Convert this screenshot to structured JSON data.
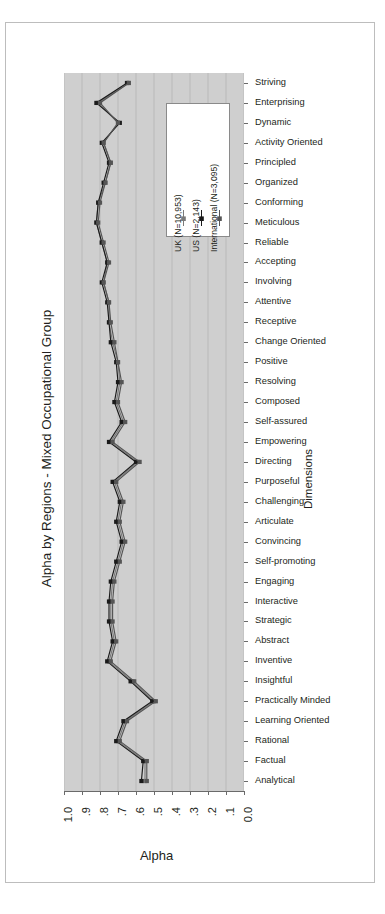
{
  "figure": {
    "title": "Alpha by Regions - Mixed Occupational Group",
    "xlabel": "Alpha",
    "ylabel": "Dimensions"
  },
  "legend": {
    "items": [
      {
        "label": "UK (N=10,953)",
        "color": "#7a7a7a",
        "marker": "error-bar-marker"
      },
      {
        "label": "US (N=2,143)",
        "color": "#1a1a1a",
        "marker": "error-bar-marker"
      },
      {
        "label": "International (N=3,095)",
        "color": "#555555",
        "marker": "error-bar-marker"
      }
    ]
  },
  "chart_data": {
    "type": "line",
    "title": "Alpha by Regions - Mixed Occupational Group",
    "xlabel": "Alpha",
    "ylabel": "Dimensions",
    "orientation": "horizontal",
    "xlim": [
      1.0,
      0.0
    ],
    "x_axis_reversed": true,
    "grid": true,
    "legend_position": "inside-top-center",
    "xticks": [
      "1.0",
      ".9",
      ".8",
      ".7",
      ".6",
      ".5",
      ".4",
      ".3",
      ".2",
      ".1",
      "0.0"
    ],
    "xtick_values": [
      1.0,
      0.9,
      0.8,
      0.7,
      0.6,
      0.5,
      0.4,
      0.3,
      0.2,
      0.1,
      0.0
    ],
    "categories": [
      "Striving",
      "Enterprising",
      "Dynamic",
      "Activity Oriented",
      "Principled",
      "Organized",
      "Conforming",
      "Meticulous",
      "Reliable",
      "Accepting",
      "Involving",
      "Attentive",
      "Receptive",
      "Change Oriented",
      "Positive",
      "Resolving",
      "Composed",
      "Self-assured",
      "Empowering",
      "Directing",
      "Purposeful",
      "Challenging",
      "Articulate",
      "Convincing",
      "Self-promoting",
      "Engaging",
      "Interactive",
      "Strategic",
      "Abstract",
      "Inventive",
      "Insightful",
      "Practically Minded",
      "Learning Oriented",
      "Rational",
      "Factual",
      "Analytical"
    ],
    "series": [
      {
        "name": "UK (N=10,953)",
        "color": "#7a7a7a",
        "values": [
          0.64,
          0.81,
          0.7,
          0.78,
          0.74,
          0.77,
          0.81,
          0.82,
          0.79,
          0.76,
          0.78,
          0.75,
          0.75,
          0.73,
          0.7,
          0.69,
          0.71,
          0.67,
          0.74,
          0.59,
          0.72,
          0.68,
          0.7,
          0.67,
          0.7,
          0.73,
          0.74,
          0.74,
          0.72,
          0.75,
          0.62,
          0.5,
          0.66,
          0.7,
          0.55,
          0.55
        ]
      },
      {
        "name": "US (N=2,143)",
        "color": "#1a1a1a",
        "values": [
          0.65,
          0.82,
          0.69,
          0.79,
          0.75,
          0.78,
          0.81,
          0.82,
          0.79,
          0.76,
          0.79,
          0.76,
          0.75,
          0.74,
          0.71,
          0.7,
          0.72,
          0.68,
          0.75,
          0.6,
          0.73,
          0.69,
          0.71,
          0.68,
          0.71,
          0.74,
          0.75,
          0.75,
          0.73,
          0.76,
          0.63,
          0.51,
          0.67,
          0.71,
          0.56,
          0.57
        ]
      },
      {
        "name": "International (N=3,095)",
        "color": "#555555",
        "values": [
          0.64,
          0.8,
          0.7,
          0.78,
          0.74,
          0.77,
          0.8,
          0.81,
          0.78,
          0.75,
          0.78,
          0.75,
          0.74,
          0.72,
          0.7,
          0.68,
          0.7,
          0.66,
          0.73,
          0.58,
          0.71,
          0.67,
          0.69,
          0.66,
          0.69,
          0.72,
          0.73,
          0.73,
          0.71,
          0.74,
          0.61,
          0.49,
          0.65,
          0.69,
          0.54,
          0.54
        ]
      }
    ]
  }
}
